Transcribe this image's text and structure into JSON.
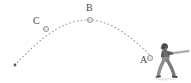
{
  "figure": {
    "width": 191,
    "height": 83,
    "background_color": "#ffffff"
  },
  "labels": {
    "point_a": "A",
    "point_b": "B",
    "point_c": "C"
  },
  "markers": [
    {
      "name": "ball-at-a",
      "label": "A",
      "x": 150,
      "y": 58,
      "r": 2.6,
      "fill": "#e8e8e8",
      "stroke": "#8a8a8a"
    },
    {
      "name": "ball-at-b",
      "label": "B",
      "x": 90,
      "y": 20,
      "r": 2.6,
      "fill": "#e8e8e8",
      "stroke": "#8a8a8a"
    },
    {
      "name": "ball-at-c",
      "label": "C",
      "x": 46,
      "y": 29,
      "r": 2.6,
      "fill": "#e8e8e8",
      "stroke": "#8a8a8a"
    }
  ],
  "trajectory": {
    "name": "projectile-path",
    "style": "dotted",
    "color": "#9a9a9a",
    "start_point": {
      "x": 152,
      "y": 57
    },
    "apex_point": {
      "x": 90,
      "y": 20
    },
    "end_point": {
      "x": 15,
      "y": 65
    },
    "end_dot": {
      "x": 15,
      "y": 65,
      "r": 1.4,
      "fill": "#555555"
    }
  },
  "figure_colors": {
    "ink": "#4a4a4a",
    "path": "#9a9a9a",
    "marker_fill": "#e8e8e8",
    "marker_stroke": "#8a8a8a",
    "batter_dark": "#4d4d4d",
    "batter_mid": "#777777",
    "batter_light": "#a8a8a8",
    "bat": "#b4b4b4"
  },
  "batter": {
    "name": "baseball-batter-figure",
    "description": "batter swinging",
    "x": 157,
    "y": 44,
    "width": 34,
    "height": 39
  }
}
